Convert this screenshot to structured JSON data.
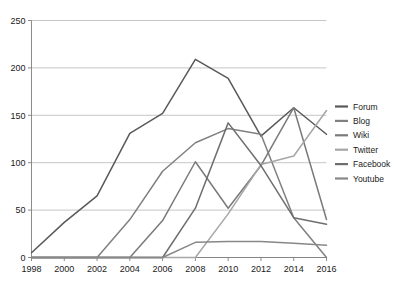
{
  "chart_data": {
    "type": "line",
    "title": "",
    "subtitle": "",
    "xlabel": "",
    "ylabel": "",
    "x": [
      1998,
      2000,
      2002,
      2004,
      2006,
      2008,
      2010,
      2012,
      2014,
      2016
    ],
    "xlim": [
      1998,
      2016
    ],
    "ylim": [
      0,
      250
    ],
    "yticks": [
      0,
      50,
      100,
      150,
      200,
      250
    ],
    "xticks": [
      1998,
      2000,
      2002,
      2004,
      2006,
      2008,
      2010,
      2012,
      2014,
      2016
    ],
    "ytick_labels": [
      "0",
      "50",
      "100",
      "150",
      "200",
      "250"
    ],
    "xtick_labels": [
      "1998",
      "2000",
      "2002",
      "2004",
      "2006",
      "2008",
      "2010",
      "2012",
      "2014",
      "2016"
    ],
    "grid": "horizontal",
    "legend_position": "right",
    "series": [
      {
        "name": "Forum",
        "color": "#595959",
        "values": [
          5,
          37,
          65,
          131,
          152,
          209,
          189,
          128,
          158,
          130
        ]
      },
      {
        "name": "Blog",
        "color": "#808080",
        "values": [
          0,
          0,
          0,
          40,
          91,
          121,
          136,
          130,
          42,
          0
        ]
      },
      {
        "name": "Wiki",
        "color": "#7a7a7a",
        "values": [
          0,
          0,
          0,
          0,
          39,
          101,
          52,
          97,
          158,
          40
        ]
      },
      {
        "name": "Twitter",
        "color": "#a6a6a6",
        "values": [
          0,
          0,
          0,
          0,
          0,
          0,
          46,
          98,
          107,
          155
        ]
      },
      {
        "name": "Facebook",
        "color": "#6e6e6e",
        "values": [
          0,
          0,
          0,
          0,
          0,
          52,
          142,
          97,
          42,
          35
        ]
      },
      {
        "name": "Youtube",
        "color": "#888888",
        "values": [
          0,
          0,
          0,
          0,
          0,
          16,
          17,
          17,
          15,
          13
        ]
      }
    ]
  },
  "legend": {
    "items": [
      {
        "label": "Forum"
      },
      {
        "label": "Blog"
      },
      {
        "label": "Wiki"
      },
      {
        "label": "Twitter"
      },
      {
        "label": "Facebook"
      },
      {
        "label": "Youtube"
      }
    ]
  },
  "colors": {
    "background": "#ffffff",
    "gridline": "#b7b7b7",
    "axis": "#7f7f7f",
    "text": "#1a1a1a"
  }
}
